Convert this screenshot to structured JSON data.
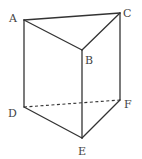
{
  "figure": {
    "type": "triangular-prism",
    "width": 142,
    "height": 159,
    "stroke_color": "#333333",
    "vertices": [
      {
        "name": "A",
        "x": 24,
        "y": 20,
        "label_x": 9,
        "label_y": 22
      },
      {
        "name": "B",
        "x": 82,
        "y": 50,
        "label_x": 85,
        "label_y": 64
      },
      {
        "name": "C",
        "x": 120,
        "y": 13,
        "label_x": 123,
        "label_y": 17
      },
      {
        "name": "D",
        "x": 24,
        "y": 107,
        "label_x": 8,
        "label_y": 117
      },
      {
        "name": "E",
        "x": 82,
        "y": 138,
        "label_x": 78,
        "label_y": 155
      },
      {
        "name": "F",
        "x": 120,
        "y": 100,
        "label_x": 124,
        "label_y": 108
      }
    ],
    "edges": [
      {
        "from": "A",
        "to": "B",
        "style": "solid"
      },
      {
        "from": "B",
        "to": "C",
        "style": "solid"
      },
      {
        "from": "C",
        "to": "A",
        "style": "solid"
      },
      {
        "from": "A",
        "to": "D",
        "style": "solid"
      },
      {
        "from": "B",
        "to": "E",
        "style": "solid"
      },
      {
        "from": "C",
        "to": "F",
        "style": "solid"
      },
      {
        "from": "D",
        "to": "E",
        "style": "solid"
      },
      {
        "from": "E",
        "to": "F",
        "style": "solid"
      },
      {
        "from": "D",
        "to": "F",
        "style": "dashed"
      }
    ]
  },
  "labels": {
    "A": "A",
    "B": "B",
    "C": "C",
    "D": "D",
    "E": "E",
    "F": "F"
  }
}
